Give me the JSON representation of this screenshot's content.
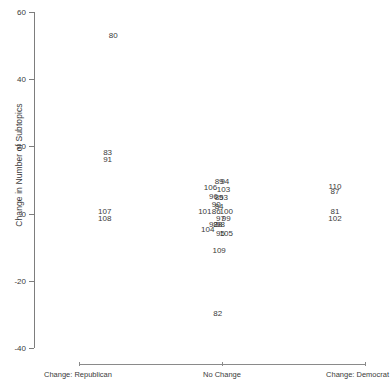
{
  "chart_data": {
    "type": "scatter",
    "title": "",
    "xlabel": "",
    "ylabel": "Change in Number of Subtopics",
    "xlim": [
      -1,
      1
    ],
    "ylim": [
      -40,
      60
    ],
    "grid": false,
    "legend": "none",
    "point_marker": "text-label",
    "x_tick_labels": [
      "Change: Republican",
      "No Change",
      "Change: Democrat"
    ],
    "x_tick_values": [
      -1,
      0,
      1
    ],
    "y_tick_labels": [
      "60",
      "40",
      "20",
      "0",
      "-20",
      "-40"
    ],
    "y_tick_values": [
      60,
      40,
      20,
      0,
      -20,
      -40
    ],
    "points": [
      {
        "label": "80",
        "x": -0.76,
        "y": 53
      },
      {
        "label": "83",
        "x": -0.8,
        "y": 18
      },
      {
        "label": "91",
        "x": -0.8,
        "y": 16
      },
      {
        "label": "107",
        "x": -0.82,
        "y": 0.5
      },
      {
        "label": "108",
        "x": -0.82,
        "y": -1.5
      },
      {
        "label": "89",
        "x": -0.02,
        "y": 9.5
      },
      {
        "label": "94",
        "x": 0.02,
        "y": 9.5
      },
      {
        "label": "106",
        "x": -0.08,
        "y": 7.5
      },
      {
        "label": "103",
        "x": 0.01,
        "y": 7
      },
      {
        "label": "96",
        "x": -0.06,
        "y": 5
      },
      {
        "label": "85",
        "x": -0.02,
        "y": 4.5
      },
      {
        "label": "93",
        "x": 0.01,
        "y": 4.5
      },
      {
        "label": "90",
        "x": -0.04,
        "y": 2.5
      },
      {
        "label": "84",
        "x": -0.02,
        "y": 2
      },
      {
        "label": "101",
        "x": -0.12,
        "y": 0.5
      },
      {
        "label": "86",
        "x": -0.04,
        "y": 0.5
      },
      {
        "label": "100",
        "x": 0.03,
        "y": 0.5
      },
      {
        "label": "97",
        "x": -0.01,
        "y": -1.5
      },
      {
        "label": "99",
        "x": 0.03,
        "y": -1.5
      },
      {
        "label": "92",
        "x": -0.06,
        "y": -3.5
      },
      {
        "label": "88",
        "x": -0.03,
        "y": -3.5
      },
      {
        "label": "98",
        "x": -0.01,
        "y": -3.5
      },
      {
        "label": "104",
        "x": -0.1,
        "y": -5
      },
      {
        "label": "95",
        "x": -0.01,
        "y": -6
      },
      {
        "label": "105",
        "x": 0.03,
        "y": -6
      },
      {
        "label": "109",
        "x": -0.02,
        "y": -11
      },
      {
        "label": "82",
        "x": -0.03,
        "y": -30
      },
      {
        "label": "110",
        "x": 0.79,
        "y": 8
      },
      {
        "label": "87",
        "x": 0.79,
        "y": 6.5
      },
      {
        "label": "81",
        "x": 0.79,
        "y": 0.5
      },
      {
        "label": "102",
        "x": 0.79,
        "y": -1.5
      }
    ]
  },
  "axes": {
    "y_title": "Change in Number of Subtopics",
    "y_ticks": [
      {
        "label": "60"
      },
      {
        "label": "40"
      },
      {
        "label": "20"
      },
      {
        "label": "0"
      },
      {
        "label": "-20"
      },
      {
        "label": "-40"
      }
    ],
    "x_ticks": [
      {
        "label": "Change: Republican"
      },
      {
        "label": "No Change"
      },
      {
        "label": "Change: Democrat"
      }
    ]
  },
  "colors": {
    "axis": "#7d7d7d",
    "text": "#3a3a3a",
    "background": "#ffffff"
  }
}
